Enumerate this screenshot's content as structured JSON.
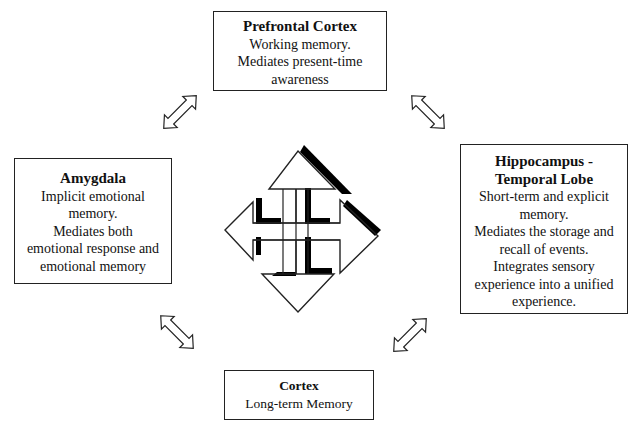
{
  "diagram": {
    "center_icon": "four-way-arrow-icon",
    "nodes": {
      "prefrontal": {
        "title": "Prefrontal Cortex",
        "lines": [
          "Working memory.",
          "Mediates present-time",
          "awareness"
        ]
      },
      "amygdala": {
        "title": "Amygdala",
        "lines": [
          "Implicit emotional",
          "memory.",
          "Mediates both",
          "emotional response and",
          "emotional memory"
        ]
      },
      "hippocampus": {
        "title_lines": [
          "Hippocampus -",
          "Temporal Lobe"
        ],
        "lines": [
          "Short-term and explicit",
          "memory.",
          "Mediates the storage and",
          "recall of events.",
          "Integrates sensory",
          "experience into a unified",
          "experience."
        ]
      },
      "cortex": {
        "title": "Cortex",
        "lines": [
          "Long-term Memory"
        ]
      }
    },
    "connectors": [
      {
        "from": "amygdala",
        "to": "prefrontal",
        "icon": "double-arrow-icon"
      },
      {
        "from": "prefrontal",
        "to": "hippocampus",
        "icon": "double-arrow-icon"
      },
      {
        "from": "amygdala",
        "to": "cortex",
        "icon": "double-arrow-icon"
      },
      {
        "from": "cortex",
        "to": "hippocampus",
        "icon": "double-arrow-icon"
      }
    ],
    "colors": {
      "stroke": "#222222",
      "fill": "#ffffff",
      "shadow": "#000000"
    }
  }
}
